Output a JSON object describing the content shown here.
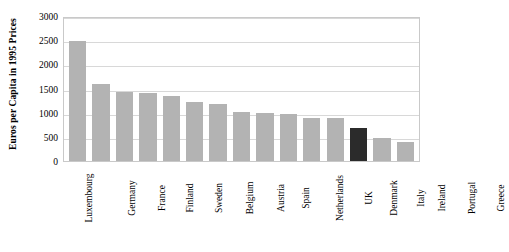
{
  "chart_data": {
    "type": "bar",
    "title": "",
    "xlabel": "",
    "ylabel": "Euros per Capita in 1995 Prices",
    "ylim": [
      0,
      3000
    ],
    "ytick_labels": [
      "3000",
      "2500",
      "2000",
      "1500",
      "1000",
      "500",
      "0"
    ],
    "ytick_values": [
      3000,
      2500,
      2000,
      1500,
      1000,
      500,
      0
    ],
    "grid": true,
    "legend": "none",
    "categories": [
      "Luxembourg",
      "Germany",
      "France",
      "Finland",
      "Sweden",
      "Belgium",
      "Austria",
      "Spain",
      "Netherlands",
      "UK",
      "Denmark",
      "Italy",
      "Ireland",
      "Portugal",
      "Greece"
    ],
    "values": [
      2490,
      1590,
      1430,
      1400,
      1350,
      1220,
      1170,
      1020,
      990,
      970,
      890,
      880,
      680,
      480,
      390
    ],
    "highlight_category": "Ireland",
    "colors": {
      "bar": "#b3b3b3",
      "bar_highlight": "#2b2b2b",
      "gridline": "#d8d8d8",
      "axis_border": "#c9c9c9",
      "text": "#000000",
      "background": "#ffffff"
    }
  }
}
